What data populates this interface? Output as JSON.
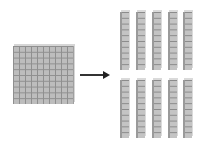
{
  "diagram": {
    "source": {
      "type": "hundred-flat",
      "grid": [
        10,
        10
      ],
      "value": 100
    },
    "arrow": {
      "direction": "right"
    },
    "target": {
      "type": "ten-rod",
      "count": 10,
      "rows": 2,
      "per_row": 5,
      "value_each": 10
    },
    "colors": {
      "block_fill": "#c0c0c0",
      "grid_line": "#8f8f8f",
      "arrow": "#222222"
    }
  }
}
